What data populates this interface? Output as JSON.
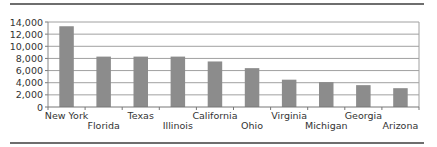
{
  "chart_data": {
    "type": "bar",
    "title": "",
    "xlabel": "",
    "ylabel": "",
    "ylim": [
      0,
      14000
    ],
    "yticks": [
      0,
      2000,
      4000,
      6000,
      8000,
      10000,
      12000,
      14000
    ],
    "ytick_labels": [
      "0",
      "2,000",
      "4,000",
      "6,000",
      "8,000",
      "10,000",
      "12,000",
      "14,000"
    ],
    "categories": [
      "New York",
      "Florida",
      "Texas",
      "Illinois",
      "California",
      "Ohio",
      "Virginia",
      "Michigan",
      "Georgia",
      "Arizona"
    ],
    "values": [
      13300,
      8300,
      8300,
      8300,
      7500,
      6400,
      4500,
      4100,
      3600,
      3100
    ],
    "grid": true,
    "legend": null,
    "bar_color": "#8c8c8c",
    "grid_color": "#a0a0a0"
  }
}
